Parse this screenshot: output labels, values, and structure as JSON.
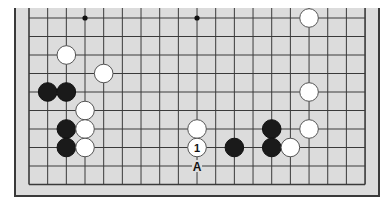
{
  "diagram": {
    "type": "go-board-fragment",
    "columns": 19,
    "rows_visible": 10,
    "edges_shown": [
      "left",
      "right",
      "bottom"
    ],
    "colors": {
      "board": "#dcdcdc",
      "line": "#3a3a3a",
      "black_stone": "#1a1a1a",
      "white_stone": "#ffffff"
    },
    "star_points": [
      {
        "col": 3,
        "row": 0
      },
      {
        "col": 9,
        "row": 0
      }
    ],
    "stones": [
      {
        "color": "white",
        "col": 15,
        "row": 0
      },
      {
        "color": "white",
        "col": 2,
        "row": 2
      },
      {
        "color": "white",
        "col": 4,
        "row": 3
      },
      {
        "color": "black",
        "col": 1,
        "row": 4
      },
      {
        "color": "black",
        "col": 2,
        "row": 4
      },
      {
        "color": "white",
        "col": 15,
        "row": 4
      },
      {
        "color": "white",
        "col": 3,
        "row": 5
      },
      {
        "color": "black",
        "col": 2,
        "row": 6
      },
      {
        "color": "white",
        "col": 3,
        "row": 6
      },
      {
        "color": "white",
        "col": 9,
        "row": 6
      },
      {
        "color": "black",
        "col": 13,
        "row": 6
      },
      {
        "color": "white",
        "col": 15,
        "row": 6
      },
      {
        "color": "black",
        "col": 2,
        "row": 7
      },
      {
        "color": "white",
        "col": 3,
        "row": 7
      },
      {
        "color": "white",
        "col": 9,
        "row": 7,
        "label": "1"
      },
      {
        "color": "black",
        "col": 11,
        "row": 7
      },
      {
        "color": "black",
        "col": 13,
        "row": 7
      },
      {
        "color": "white",
        "col": 14,
        "row": 7
      }
    ],
    "point_labels": [
      {
        "col": 9,
        "row": 8,
        "text": "A"
      }
    ]
  }
}
